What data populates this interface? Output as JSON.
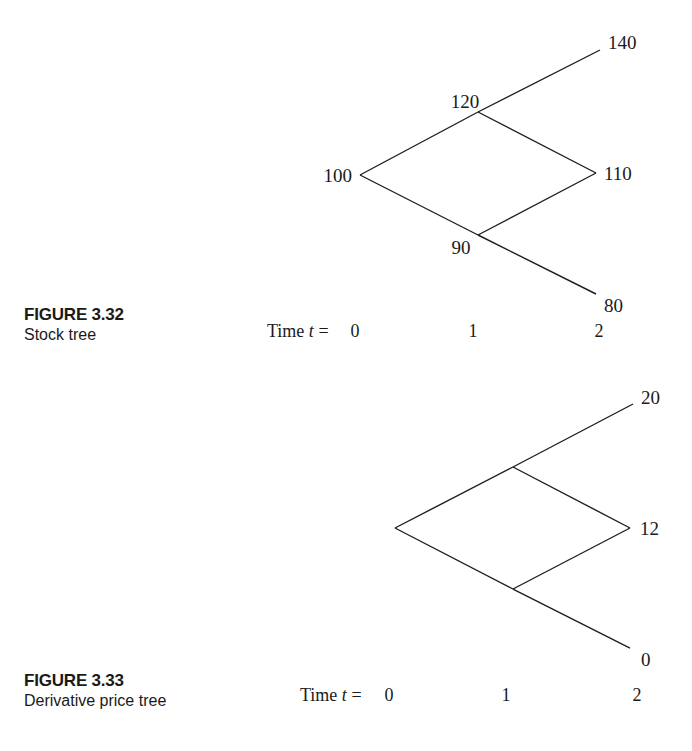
{
  "figures": [
    {
      "label": "FIGURE 3.32",
      "caption": "Stock tree",
      "time_label_prefix": "Time ",
      "time_label_var": "t",
      "time_label_eq": " = ",
      "time_ticks": [
        "0",
        "1",
        "2"
      ],
      "nodes": {
        "t0": "100",
        "t1_up": "120",
        "t1_down": "90",
        "t2_upup": "140",
        "t2_mid": "110",
        "t2_downdown": "80"
      }
    },
    {
      "label": "FIGURE 3.33",
      "caption": "Derivative price tree",
      "time_label_prefix": "Time ",
      "time_label_var": "t",
      "time_label_eq": " = ",
      "time_ticks": [
        "0",
        "1",
        "2"
      ],
      "nodes": {
        "t0": "",
        "t1_up": "",
        "t1_down": "",
        "t2_upup": "20",
        "t2_mid": "12",
        "t2_downdown": "0"
      }
    }
  ]
}
